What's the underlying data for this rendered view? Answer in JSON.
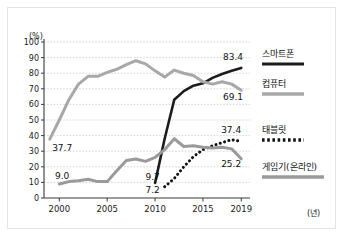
{
  "chart_data": {
    "type": "line",
    "title": "",
    "subtitle": "",
    "xlabel": "(년)",
    "ylabel": "(%)",
    "xlim": [
      1998.4,
      2019.6
    ],
    "ylim": [
      0,
      100
    ],
    "grid": true,
    "grid_axis": "y",
    "legend_position": "right",
    "y_ticks": [
      "100",
      "90",
      "80",
      "70",
      "60",
      "50",
      "40",
      "30",
      "20",
      "10",
      "0"
    ],
    "y_tick_values": [
      100,
      90,
      80,
      70,
      60,
      50,
      40,
      30,
      20,
      10,
      0
    ],
    "x_ticks": [
      "2000",
      "2005",
      "2010",
      "2015",
      "2019"
    ],
    "x_tick_values": [
      2000,
      2005,
      2010,
      2015,
      2019
    ],
    "series": [
      {
        "name": "스마트폰",
        "style": "solid",
        "color": "#1c1c1c",
        "width": 2.6,
        "x": [
          2010,
          2011,
          2012,
          2013,
          2014,
          2015,
          2016,
          2017,
          2018,
          2019
        ],
        "values": [
          9.7,
          38.0,
          63.0,
          68.5,
          72.0,
          73.5,
          77.0,
          79.5,
          81.5,
          83.4
        ]
      },
      {
        "name": "컴퓨터",
        "style": "solid",
        "color": "#a8a8a8",
        "width": 3.0,
        "x": [
          1999,
          2000,
          2001,
          2002,
          2003,
          2004,
          2005,
          2006,
          2007,
          2008,
          2009,
          2010,
          2011,
          2012,
          2013,
          2014,
          2015,
          2016,
          2017,
          2018,
          2019
        ],
        "values": [
          37.7,
          50.0,
          63.0,
          73.0,
          78.0,
          78.0,
          80.5,
          82.5,
          85.5,
          88.0,
          86.0,
          81.5,
          77.5,
          82.0,
          80.0,
          78.5,
          74.5,
          73.0,
          74.5,
          73.0,
          69.1
        ]
      },
      {
        "name": "태블릿",
        "style": "dotted",
        "color": "#121212",
        "width": 3.0,
        "x": [
          2011,
          2012,
          2013,
          2014,
          2015,
          2016,
          2017,
          2018,
          2019
        ],
        "values": [
          7.2,
          12.5,
          20.0,
          26.5,
          31.0,
          33.5,
          35.5,
          37.4,
          36.2
        ]
      },
      {
        "name": "게임기(온라인)",
        "style": "solid",
        "color": "#9a9a9a",
        "width": 3.0,
        "x": [
          2000,
          2001,
          2002,
          2003,
          2004,
          2005,
          2006,
          2007,
          2008,
          2009,
          2010,
          2011,
          2012,
          2013,
          2014,
          2015,
          2016,
          2017,
          2018,
          2019
        ],
        "values": [
          9.0,
          10.5,
          11.0,
          12.0,
          10.5,
          10.5,
          17.5,
          24.0,
          25.0,
          23.5,
          26.0,
          31.0,
          38.0,
          33.0,
          33.5,
          32.5,
          32.0,
          32.5,
          31.5,
          25.2
        ]
      }
    ],
    "annotations": [
      {
        "id": "computer-start",
        "text": "37.7",
        "x": 1999.25,
        "y": 30.0,
        "anchor": "start"
      },
      {
        "id": "game-start",
        "text": "9.0",
        "x": 1999.55,
        "y": 12.5,
        "anchor": "start"
      },
      {
        "id": "smartphone-start",
        "text": "9.7",
        "x": 2009.0,
        "y": 11.5,
        "anchor": "start"
      },
      {
        "id": "tablet-start",
        "text": "7.2",
        "x": 2009.0,
        "y": 3.0,
        "anchor": "start"
      },
      {
        "id": "smartphone-end",
        "text": "83.4",
        "x": 2017.1,
        "y": 88.5,
        "anchor": "start"
      },
      {
        "id": "computer-end",
        "text": "69.1",
        "x": 2017.1,
        "y": 63.0,
        "anchor": "start"
      },
      {
        "id": "tablet-peak",
        "text": "37.4",
        "x": 2016.9,
        "y": 41.5,
        "anchor": "start"
      },
      {
        "id": "game-end",
        "text": "25.2",
        "x": 2016.9,
        "y": 20.0,
        "anchor": "start"
      }
    ],
    "legend_entries": [
      {
        "label": "스마트폰",
        "style": "solid",
        "color": "#1c1c1c"
      },
      {
        "label": "컴퓨터",
        "style": "solid",
        "color": "#a8a8a8"
      },
      {
        "label": "태블릿",
        "style": "dotted",
        "color": "#121212"
      },
      {
        "label": "게임기(온라인)",
        "style": "solid",
        "color": "#9a9a9a"
      }
    ]
  }
}
